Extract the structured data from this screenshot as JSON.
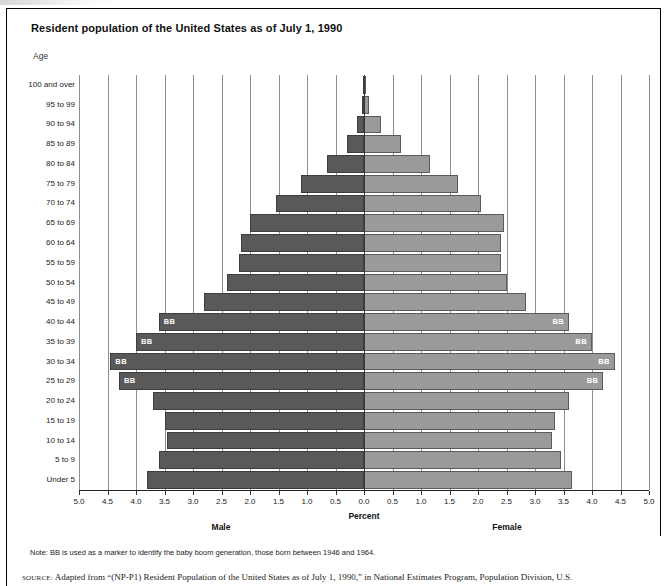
{
  "figure": {
    "title": "Resident population of the United States as of July 1, 1990",
    "age_axis_label": "Age",
    "percent_label": "Percent",
    "male_label": "Male",
    "female_label": "Female",
    "bb_marker": "BB",
    "note": "Note: BB is used as a marker to identify the baby boom generation, those born between 1946 and 1964.",
    "source_prefix": "SOURCE:",
    "source": "Adapted from “(NP-P1) Resident Population of the United States as of July 1, 1990,” in National Estimates Program, Population Division, U.S."
  },
  "colors": {
    "male_bar": "#595959",
    "female_bar": "#9a9a9a",
    "gridline": "#8e8e8e",
    "center_axis": "#3a3a3a",
    "bb_text": "#ffffff",
    "frame": "#000000"
  },
  "chart_data": {
    "type": "bar",
    "subtype": "population-pyramid",
    "title": "Resident population of the United States as of July 1, 1990",
    "xlabel": "Percent",
    "ylabel": "Age",
    "xlim": [
      -5.0,
      5.0
    ],
    "grid": true,
    "legend": "none",
    "xtick_labels": [
      "5.0",
      "4.5",
      "4.0",
      "3.5",
      "3.0",
      "2.5",
      "2.0",
      "1.5",
      "1.0",
      "0.5",
      "0.0",
      "0.5",
      "1.0",
      "1.5",
      "2.0",
      "2.5",
      "3.0",
      "3.5",
      "4.0",
      "4.5",
      "5.0"
    ],
    "xtick_values": [
      -5.0,
      -4.5,
      -4.0,
      -3.5,
      -3.0,
      -2.5,
      -2.0,
      -1.5,
      -1.0,
      -0.5,
      0.0,
      0.5,
      1.0,
      1.5,
      2.0,
      2.5,
      3.0,
      3.5,
      4.0,
      4.5,
      5.0
    ],
    "categories": [
      "100 and over",
      "95 to 99",
      "90 to 94",
      "85 to 89",
      "80 to 84",
      "75 to 79",
      "70 to 74",
      "65 to 69",
      "60 to 64",
      "55 to 59",
      "50 to 54",
      "45 to 49",
      "40 to 44",
      "35 to 39",
      "30 to 34",
      "25 to 29",
      "20 to 24",
      "15 to 19",
      "10 to 14",
      "5 to 9",
      "Under 5"
    ],
    "series": [
      {
        "name": "Male",
        "side": "left",
        "color": "#595959",
        "values": [
          0.01,
          0.03,
          0.12,
          0.3,
          0.65,
          1.1,
          1.55,
          2.0,
          2.15,
          2.2,
          2.4,
          2.8,
          3.6,
          4.0,
          4.45,
          4.3,
          3.7,
          3.5,
          3.45,
          3.6,
          3.8
        ]
      },
      {
        "name": "Female",
        "side": "right",
        "color": "#9a9a9a",
        "values": [
          0.02,
          0.09,
          0.3,
          0.65,
          1.15,
          1.65,
          2.05,
          2.45,
          2.4,
          2.4,
          2.5,
          2.85,
          3.6,
          4.0,
          4.4,
          4.2,
          3.6,
          3.35,
          3.3,
          3.45,
          3.65
        ]
      }
    ],
    "baby_boom_marked_categories": [
      "40 to 44",
      "35 to 39",
      "30 to 34",
      "25 to 29"
    ],
    "annotations": [
      {
        "category": "40 to 44",
        "text": "BB",
        "sides": [
          "left",
          "right"
        ]
      },
      {
        "category": "35 to 39",
        "text": "BB",
        "sides": [
          "left",
          "right"
        ]
      },
      {
        "category": "30 to 34",
        "text": "BB",
        "sides": [
          "left",
          "right"
        ]
      },
      {
        "category": "25 to 29",
        "text": "BB",
        "sides": [
          "left",
          "right"
        ]
      }
    ]
  }
}
